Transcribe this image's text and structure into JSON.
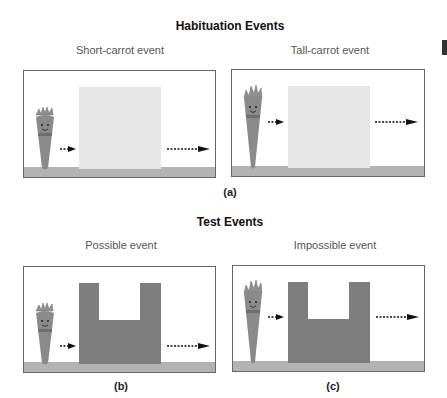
{
  "habituation": {
    "title": "Habituation Events",
    "caption": "(a)",
    "panels": [
      {
        "label": "Short-carrot event",
        "carrot": "short",
        "screen": "rectangle"
      },
      {
        "label": "Tall-carrot event",
        "carrot": "tall",
        "screen": "rectangle"
      }
    ]
  },
  "test": {
    "title": "Test Events",
    "panels": [
      {
        "label": "Possible event",
        "caption": "(b)",
        "carrot": "short",
        "screen": "notched"
      },
      {
        "label": "Impossible event",
        "caption": "(c)",
        "carrot": "tall",
        "screen": "notched"
      }
    ]
  },
  "colors": {
    "light_screen": "#e6e6e6",
    "dark_screen": "#7d7d7d",
    "ground": "#b3b3b3",
    "carrot": "#8a8a8a",
    "arrow": "#111111"
  },
  "icons": [
    "carrot-icon",
    "arrow-right-icon",
    "dotted-arrow-right-icon"
  ]
}
